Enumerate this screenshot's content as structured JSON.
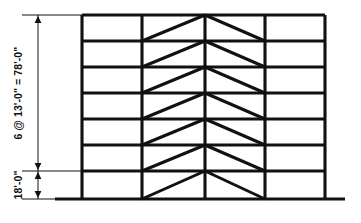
{
  "figure": {
    "type": "structural-elevation-diagram"
  },
  "dimensions": {
    "upper": {
      "label": "6 @ 13'-0\" = 78'-0\"",
      "bays": 6,
      "each": "13'-0\"",
      "total": "78'-0\""
    },
    "lower": {
      "label": "18'-0\"",
      "stories": 1,
      "each": "18'-0\""
    }
  },
  "frame": {
    "stories": 7,
    "bays": 4,
    "bracing_type": "chevron",
    "braced_bays": [
      2,
      3
    ],
    "column_x": [
      82,
      142,
      205,
      265,
      325
    ],
    "level_y": [
      15,
      41,
      67,
      93,
      119,
      145,
      171,
      199
    ],
    "ground_line": {
      "x1": 55,
      "x2": 345,
      "y": 199
    }
  },
  "style": {
    "member_color": "#111111",
    "ground_color": "#111111",
    "dimension_color": "#111111",
    "background": "#ffffff",
    "member_width": 3.1,
    "brace_width": 3.0,
    "ground_width": 3.2,
    "dimension_width": 1.0
  },
  "dimension_lines": {
    "vertical_x": 38,
    "extension_left_x": 22,
    "extension_right_x": 88,
    "top_y": 15,
    "break_y": 171,
    "bottom_y": 199
  }
}
